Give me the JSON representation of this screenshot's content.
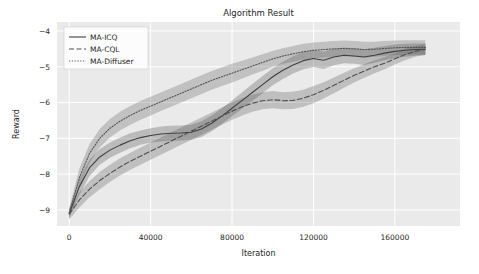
{
  "chart_data": {
    "type": "line",
    "title": "Algorithm Result",
    "xlabel": "Iteration",
    "ylabel": "Reward",
    "xlim": [
      -6000,
      192000
    ],
    "ylim": [
      -9.45,
      -3.75
    ],
    "grid": true,
    "legend_position": "upper left",
    "xticks": [
      0,
      40000,
      80000,
      120000,
      160000
    ],
    "xtick_labels": [
      "0",
      "40000",
      "80000",
      "120000",
      "160000"
    ],
    "yticks": [
      -4,
      -5,
      -6,
      -7,
      -8,
      -9
    ],
    "ytick_labels": [
      "−4",
      "−5",
      "−6",
      "−7",
      "−8",
      "−9"
    ],
    "x": [
      0,
      5000,
      10000,
      15000,
      20000,
      25000,
      30000,
      35000,
      40000,
      45000,
      50000,
      55000,
      60000,
      65000,
      70000,
      75000,
      80000,
      85000,
      90000,
      95000,
      100000,
      105000,
      110000,
      115000,
      120000,
      125000,
      130000,
      135000,
      140000,
      145000,
      150000,
      155000,
      160000,
      165000,
      170000,
      175000
    ],
    "series": [
      {
        "name": "MA-ICQ",
        "style": "solid",
        "color": "#3f3f3f",
        "values": [
          -9.1,
          -8.35,
          -7.82,
          -7.52,
          -7.33,
          -7.19,
          -7.07,
          -6.98,
          -6.92,
          -6.88,
          -6.86,
          -6.85,
          -6.83,
          -6.74,
          -6.58,
          -6.38,
          -6.16,
          -5.94,
          -5.72,
          -5.5,
          -5.28,
          -5.1,
          -4.95,
          -4.83,
          -4.77,
          -4.82,
          -4.73,
          -4.68,
          -4.7,
          -4.73,
          -4.68,
          -4.62,
          -4.57,
          -4.54,
          -4.52,
          -4.51
        ],
        "band_lower": [
          -9.22,
          -8.58,
          -8.05,
          -7.74,
          -7.54,
          -7.4,
          -7.28,
          -7.18,
          -7.12,
          -7.09,
          -7.07,
          -7.06,
          -7.04,
          -6.96,
          -6.8,
          -6.6,
          -6.38,
          -6.17,
          -5.96,
          -5.74,
          -5.52,
          -5.34,
          -5.19,
          -5.07,
          -5.01,
          -5.06,
          -4.96,
          -4.9,
          -4.92,
          -4.95,
          -4.89,
          -4.82,
          -4.76,
          -4.72,
          -4.69,
          -4.67
        ],
        "band_upper": [
          -8.98,
          -8.12,
          -7.59,
          -7.3,
          -7.12,
          -6.98,
          -6.86,
          -6.78,
          -6.72,
          -6.67,
          -6.65,
          -6.64,
          -6.62,
          -6.52,
          -6.36,
          -6.16,
          -5.94,
          -5.71,
          -5.48,
          -5.26,
          -5.04,
          -4.86,
          -4.71,
          -4.59,
          -4.53,
          -4.58,
          -4.5,
          -4.46,
          -4.48,
          -4.51,
          -4.47,
          -4.42,
          -4.38,
          -4.36,
          -4.35,
          -4.35
        ]
      },
      {
        "name": "MA-CQL",
        "style": "dashed",
        "color": "#4f4f4f",
        "values": [
          -9.12,
          -8.72,
          -8.42,
          -8.18,
          -7.98,
          -7.8,
          -7.64,
          -7.5,
          -7.36,
          -7.22,
          -7.08,
          -6.94,
          -6.8,
          -6.66,
          -6.52,
          -6.38,
          -6.24,
          -6.12,
          -6.02,
          -5.95,
          -5.92,
          -5.95,
          -5.94,
          -5.88,
          -5.78,
          -5.66,
          -5.52,
          -5.38,
          -5.24,
          -5.12,
          -5.0,
          -4.9,
          -4.78,
          -4.66,
          -4.57,
          -4.52
        ],
        "band_lower": [
          -9.26,
          -8.93,
          -8.65,
          -8.42,
          -8.22,
          -8.04,
          -7.88,
          -7.74,
          -7.6,
          -7.46,
          -7.32,
          -7.18,
          -7.04,
          -6.9,
          -6.76,
          -6.62,
          -6.48,
          -6.36,
          -6.26,
          -6.19,
          -6.16,
          -6.19,
          -6.18,
          -6.12,
          -6.02,
          -5.89,
          -5.74,
          -5.59,
          -5.44,
          -5.31,
          -5.18,
          -5.07,
          -4.94,
          -4.82,
          -4.72,
          -4.67
        ],
        "band_upper": [
          -8.98,
          -8.51,
          -8.19,
          -7.94,
          -7.74,
          -7.56,
          -7.4,
          -7.26,
          -7.12,
          -6.98,
          -6.84,
          -6.7,
          -6.56,
          -6.42,
          -6.28,
          -6.14,
          -6.0,
          -5.88,
          -5.78,
          -5.71,
          -5.68,
          -5.71,
          -5.7,
          -5.64,
          -5.54,
          -5.43,
          -5.3,
          -5.17,
          -5.04,
          -4.93,
          -4.82,
          -4.73,
          -4.62,
          -4.5,
          -4.42,
          -4.37
        ]
      },
      {
        "name": "MA-Diffuser",
        "style": "dotted",
        "color": "#555555",
        "values": [
          -9.08,
          -8.1,
          -7.42,
          -7.0,
          -6.72,
          -6.52,
          -6.36,
          -6.22,
          -6.1,
          -5.98,
          -5.86,
          -5.74,
          -5.62,
          -5.5,
          -5.38,
          -5.28,
          -5.18,
          -5.08,
          -4.98,
          -4.88,
          -4.78,
          -4.7,
          -4.64,
          -4.58,
          -4.54,
          -4.52,
          -4.5,
          -4.49,
          -4.5,
          -4.52,
          -4.51,
          -4.49,
          -4.47,
          -4.46,
          -4.46,
          -4.46
        ],
        "band_lower": [
          -9.24,
          -8.36,
          -7.68,
          -7.26,
          -6.98,
          -6.78,
          -6.62,
          -6.48,
          -6.36,
          -6.24,
          -6.12,
          -6.0,
          -5.88,
          -5.76,
          -5.64,
          -5.54,
          -5.44,
          -5.33,
          -5.22,
          -5.11,
          -5.0,
          -4.92,
          -4.86,
          -4.8,
          -4.76,
          -4.74,
          -4.72,
          -4.71,
          -4.72,
          -4.74,
          -4.72,
          -4.7,
          -4.67,
          -4.66,
          -4.66,
          -4.66
        ],
        "band_upper": [
          -8.94,
          -7.84,
          -7.16,
          -6.74,
          -6.46,
          -6.26,
          -6.1,
          -5.96,
          -5.84,
          -5.72,
          -5.6,
          -5.48,
          -5.36,
          -5.24,
          -5.12,
          -5.02,
          -4.92,
          -4.83,
          -4.74,
          -4.65,
          -4.56,
          -4.48,
          -4.42,
          -4.36,
          -4.32,
          -4.3,
          -4.28,
          -4.27,
          -4.28,
          -4.3,
          -4.3,
          -4.28,
          -4.27,
          -4.26,
          -4.26,
          -4.26
        ]
      }
    ],
    "style": {
      "axes_facecolor": "#eaeaea",
      "figure_facecolor": "#ffffff",
      "gridline_color": "#ffffff",
      "band_alpha": 0.28
    }
  }
}
